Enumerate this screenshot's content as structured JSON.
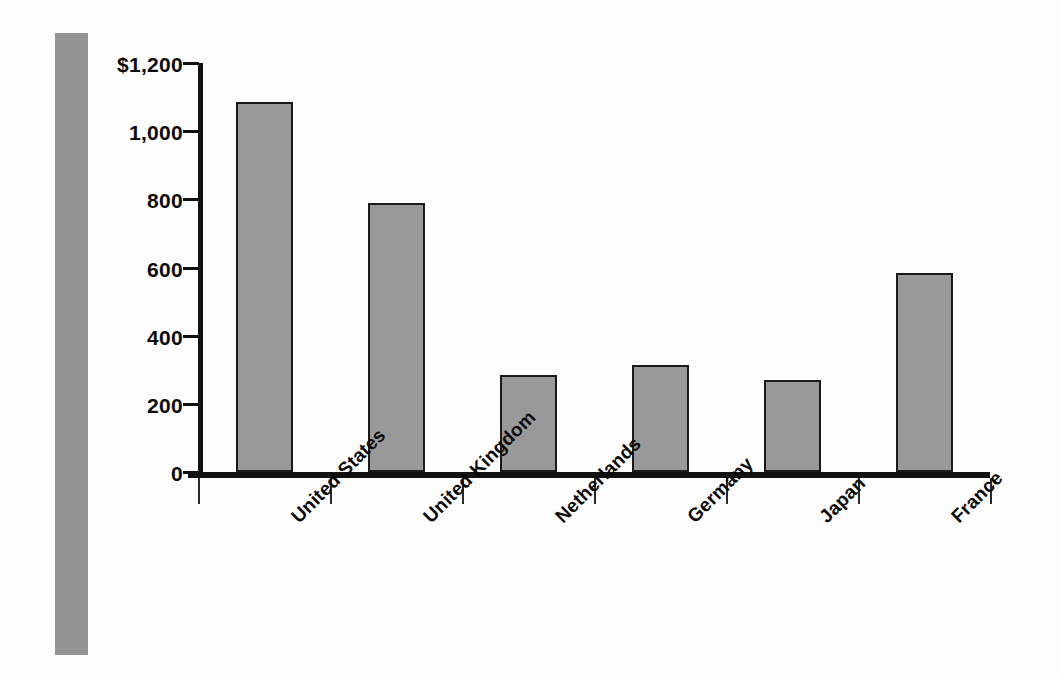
{
  "chart_data": {
    "type": "bar",
    "title": "",
    "subtitle": "",
    "xlabel": "",
    "ylabel": "",
    "categories": [
      "United States",
      "United Kingdom",
      "Netherlands",
      "Germany",
      "Japan",
      "France"
    ],
    "values": [
      1085,
      790,
      285,
      315,
      270,
      585
    ],
    "ylim": [
      0,
      1200
    ],
    "ytick_values": [
      1200,
      1000,
      800,
      600,
      400,
      200,
      0
    ],
    "ytick_labels": [
      "$1,200",
      "1,000",
      "800",
      "600",
      "400",
      "200",
      "0"
    ],
    "grid": false,
    "legend": null,
    "series": [
      {
        "name": "",
        "values": [
          1085,
          790,
          285,
          315,
          270,
          585
        ]
      }
    ],
    "bar_color": "#999999",
    "bar_border_color": "#1a1a1a",
    "axis_color": "#111111",
    "background_color": "#fdfdfd"
  },
  "decoration": {
    "spine_color": "#949494",
    "spine_name": "left-gray-spine"
  }
}
